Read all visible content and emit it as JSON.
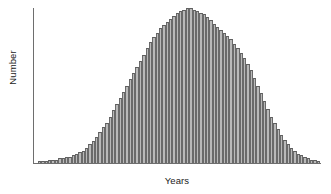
{
  "chart_data": {
    "type": "bar",
    "title": "",
    "subtitle": "",
    "xlabel": "Years",
    "ylabel": "Number",
    "grid": false,
    "legend": null,
    "xticklabels": [],
    "yticklabels": [],
    "ylim": [
      0,
      100
    ],
    "annotation": "Bell-shaped (approximately normal) distribution of number versus years",
    "bar_fill_color": "#b9b9b9",
    "bar_edge_color": "#6a6a6a",
    "axis_color": "#6e6e6e",
    "text_color": "#1b1b1b",
    "background_color": "#ffffff",
    "categories": [
      "1",
      "2",
      "3",
      "4",
      "5",
      "6",
      "7",
      "8",
      "9",
      "10",
      "11",
      "12",
      "13",
      "14",
      "15",
      "16",
      "17",
      "18",
      "19",
      "20",
      "21",
      "22",
      "23",
      "24",
      "25",
      "26",
      "27",
      "28",
      "29",
      "30",
      "31",
      "32",
      "33",
      "34",
      "35",
      "36",
      "37",
      "38",
      "39",
      "40",
      "41",
      "42",
      "43",
      "44",
      "45",
      "46",
      "47",
      "48",
      "49",
      "50",
      "51",
      "52",
      "53",
      "54",
      "55",
      "56",
      "57",
      "58",
      "59",
      "60",
      "61",
      "62",
      "63",
      "64",
      "65",
      "66",
      "67",
      "68",
      "69",
      "70",
      "71",
      "72",
      "73",
      "74",
      "75",
      "76",
      "77",
      "78",
      "79",
      "80",
      "81",
      "82",
      "83",
      "84"
    ],
    "values": [
      1,
      1,
      1,
      2,
      2,
      2,
      3,
      3,
      4,
      4,
      5,
      6,
      7,
      8,
      10,
      12,
      14,
      17,
      20,
      23,
      26,
      30,
      34,
      38,
      42,
      46,
      50,
      54,
      58,
      62,
      66,
      70,
      74,
      78,
      81,
      84,
      87,
      89,
      91,
      93,
      95,
      97,
      98,
      99,
      100,
      100,
      99,
      98,
      97,
      96,
      94,
      92,
      90,
      88,
      86,
      84,
      82,
      80,
      77,
      74,
      71,
      68,
      64,
      60,
      55,
      50,
      45,
      40,
      35,
      30,
      26,
      22,
      18,
      15,
      12,
      10,
      8,
      6,
      5,
      4,
      3,
      2,
      2,
      1
    ]
  }
}
